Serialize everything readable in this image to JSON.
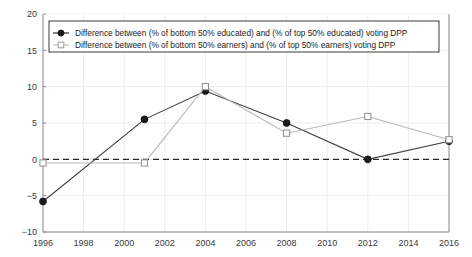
{
  "chart_data": {
    "type": "line",
    "title": "",
    "subtitle": "",
    "xlabel": "",
    "ylabel": "",
    "x": [
      1996,
      2001,
      2004,
      2008,
      2012,
      2016
    ],
    "xlim": [
      1996,
      2016
    ],
    "ylim": [
      -10,
      20
    ],
    "xticks": [
      "1996",
      "1998",
      "2000",
      "2002",
      "2004",
      "2006",
      "2008",
      "2010",
      "2012",
      "2014",
      "2016"
    ],
    "xtick_values": [
      1996,
      1998,
      2000,
      2002,
      2004,
      2006,
      2008,
      2010,
      2012,
      2014,
      2016
    ],
    "yticks": [
      "-10",
      "-5",
      "0",
      "5",
      "10",
      "15",
      "20"
    ],
    "ytick_values": [
      -10,
      -5,
      0,
      5,
      10,
      15,
      20
    ],
    "grid": true,
    "grid_axis": "both",
    "zero_reference_line": 0,
    "zero_line_style": "dashed",
    "legend_position": "top-left-inside",
    "series": [
      {
        "name": "Difference between (% of bottom 50% educated) and (% of top 50% educated) voting DPP",
        "marker": "filled-circle",
        "color": "#1a1a1a",
        "line_color": "#3d3d3d",
        "x": [
          1996,
          2001,
          2004,
          2008,
          2012,
          2016
        ],
        "values": [
          -5.8,
          5.5,
          9.4,
          5.0,
          0.0,
          2.5
        ]
      },
      {
        "name": "Difference between (% of bottom 50% earners) and (% of top 50% earners) voting DPP",
        "marker": "open-square",
        "color": "#ffffff",
        "line_color": "#b8b8b8",
        "x": [
          1996,
          2001,
          2004,
          2008,
          2012,
          2016
        ],
        "values": [
          -0.5,
          -0.5,
          10.0,
          3.6,
          5.9,
          2.7
        ]
      }
    ]
  },
  "legend": {
    "entries": [
      {
        "label": "Difference between (% of bottom 50% educated) and (% of top 50% educated) voting DPP",
        "marker": "filled-circle",
        "marker_name": "legend-marker-filled-circle"
      },
      {
        "label": "Difference between (% of bottom 50% earners) and (% of top 50% earners) voting DPP",
        "marker": "open-square",
        "marker_name": "legend-marker-open-square"
      }
    ]
  },
  "colors": {
    "background": "#ffffff",
    "axis": "#8c8c8c",
    "grid": "#ededed",
    "series_educated": "#3d3d3d",
    "series_earners": "#b8b8b8",
    "zero_line": "#2a2a2a",
    "text": "#3a3a3a"
  }
}
